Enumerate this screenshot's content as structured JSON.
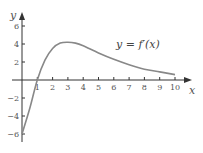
{
  "chart_data": {
    "type": "line",
    "title": "",
    "annotation": "y = f′(x)",
    "xlabel": "x",
    "ylabel": "y",
    "xlim": [
      0,
      10
    ],
    "ylim": [
      -6,
      6
    ],
    "x_ticks": [
      "1",
      "2",
      "3",
      "4",
      "5",
      "6",
      "7",
      "8",
      "9",
      "10"
    ],
    "y_ticks": [
      "6",
      "4",
      "2",
      "-2",
      "-4",
      "-6"
    ],
    "grid": false,
    "series": [
      {
        "name": "f'(x)",
        "x": [
          0,
          0.5,
          1,
          1.5,
          2,
          2.5,
          3,
          3.5,
          4,
          5,
          6,
          7,
          8,
          9,
          10
        ],
        "y": [
          -6,
          -3.2,
          0,
          2.2,
          3.5,
          4.1,
          4.2,
          4.1,
          3.8,
          3.0,
          2.3,
          1.7,
          1.2,
          0.9,
          0.6
        ]
      }
    ]
  }
}
